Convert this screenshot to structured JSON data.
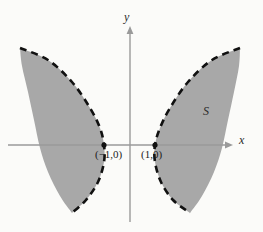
{
  "figure": {
    "background_color": "#fbfbf9",
    "width": 263,
    "height": 232,
    "region_fill_color": "#a8a8a8",
    "boundary_color": "#111111",
    "axis_color": "#9a9a9a"
  },
  "axes": {
    "x_label": "x",
    "y_label": "y",
    "x_axis_y_px": 145,
    "y_axis_x_px": 130
  },
  "labels": {
    "point_left": "(−1,0)",
    "point_right": "(1,0)",
    "region": "S"
  },
  "chart_data": {
    "type": "area",
    "title": "",
    "subtitle": "",
    "xlabel": "x",
    "ylabel": "y",
    "grid": false,
    "legend": null,
    "annotations": [
      {
        "text": "(−1,0)",
        "x": -1,
        "y": 0,
        "note": "left region touches x-axis"
      },
      {
        "text": "(1,0)",
        "x": 1,
        "y": 0,
        "note": "right region touches x-axis"
      },
      {
        "text": "S",
        "x": 1.9,
        "y": 0.75,
        "note": "shaded region label"
      }
    ],
    "boundary_curve_style": "dashed",
    "regions": [
      {
        "name": "left-region",
        "boundary_points_px": [
          [
            20,
            48
          ],
          [
            48,
            60
          ],
          [
            72,
            82
          ],
          [
            90,
            108
          ],
          [
            100,
            128
          ],
          [
            104,
            145
          ],
          [
            104,
            162
          ],
          [
            98,
            182
          ],
          [
            86,
            200
          ],
          [
            72,
            213
          ]
        ],
        "outer_points_px": [
          [
            72,
            213
          ],
          [
            60,
            196
          ],
          [
            48,
            172
          ],
          [
            40,
            148
          ],
          [
            34,
            120
          ],
          [
            28,
            92
          ],
          [
            22,
            66
          ],
          [
            20,
            48
          ]
        ]
      },
      {
        "name": "right-region",
        "boundary_points_px": [
          [
            240,
            48
          ],
          [
            212,
            60
          ],
          [
            188,
            82
          ],
          [
            170,
            108
          ],
          [
            160,
            128
          ],
          [
            155,
            145
          ],
          [
            155,
            162
          ],
          [
            161,
            182
          ],
          [
            173,
            200
          ],
          [
            190,
            213
          ]
        ],
        "outer_points_px": [
          [
            190,
            213
          ],
          [
            202,
            196
          ],
          [
            214,
            172
          ],
          [
            222,
            148
          ],
          [
            228,
            120
          ],
          [
            234,
            92
          ],
          [
            239,
            66
          ],
          [
            240,
            48
          ]
        ]
      }
    ],
    "axis_ranges": {
      "xlim": [
        -2.7,
        2.2
      ],
      "ylim": [
        -1.6,
        2.5
      ]
    }
  }
}
